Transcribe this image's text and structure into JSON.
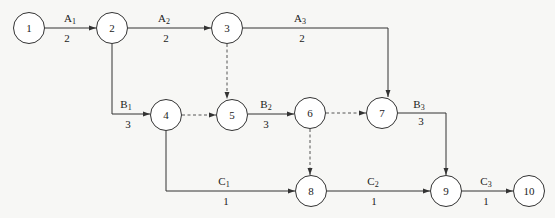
{
  "diagram": {
    "type": "activity-on-arrow network",
    "nodes": [
      {
        "id": "1",
        "label": "1",
        "x": 29,
        "y": 36
      },
      {
        "id": "2",
        "label": "2",
        "x": 112,
        "y": 28
      },
      {
        "id": "3",
        "label": "3",
        "x": 227,
        "y": 28
      },
      {
        "id": "4",
        "label": "4",
        "x": 166,
        "y": 115
      },
      {
        "id": "5",
        "label": "5",
        "x": 232,
        "y": 115
      },
      {
        "id": "6",
        "label": "6",
        "x": 310,
        "y": 113
      },
      {
        "id": "7",
        "label": "7",
        "x": 382,
        "y": 113
      },
      {
        "id": "8",
        "label": "8",
        "x": 311,
        "y": 191
      },
      {
        "id": "9",
        "label": "9",
        "x": 446,
        "y": 191
      },
      {
        "id": "10",
        "label": "10",
        "x": 529,
        "y": 191
      }
    ],
    "activities": [
      {
        "name": "A",
        "sub": "1",
        "duration": "2",
        "from": "1",
        "to": "2",
        "style": "solid"
      },
      {
        "name": "A",
        "sub": "2",
        "duration": "2",
        "from": "2",
        "to": "3",
        "style": "solid"
      },
      {
        "name": "A",
        "sub": "3",
        "duration": "2",
        "from": "3",
        "to": "7",
        "style": "solid"
      },
      {
        "name": "B",
        "sub": "1",
        "duration": "3",
        "from": "2",
        "to": "4",
        "style": "solid"
      },
      {
        "name": "B",
        "sub": "2",
        "duration": "3",
        "from": "5",
        "to": "6",
        "style": "solid"
      },
      {
        "name": "B",
        "sub": "3",
        "duration": "3",
        "from": "7",
        "to": "9",
        "style": "solid"
      },
      {
        "name": "C",
        "sub": "1",
        "duration": "1",
        "from": "4",
        "to": "8",
        "style": "solid"
      },
      {
        "name": "C",
        "sub": "2",
        "duration": "1",
        "from": "8",
        "to": "9",
        "style": "solid"
      },
      {
        "name": "C",
        "sub": "3",
        "duration": "1",
        "from": "9",
        "to": "10",
        "style": "solid"
      }
    ],
    "dummy_activities": [
      {
        "from": "3",
        "to": "5",
        "style": "dashed"
      },
      {
        "from": "4",
        "to": "5",
        "style": "dashed"
      },
      {
        "from": "6",
        "to": "7",
        "style": "dashed"
      },
      {
        "from": "6",
        "to": "8",
        "style": "dashed"
      }
    ]
  },
  "colors": {
    "line": "#333333",
    "background": "#f7f7f5",
    "node_fill": "#ffffff"
  }
}
